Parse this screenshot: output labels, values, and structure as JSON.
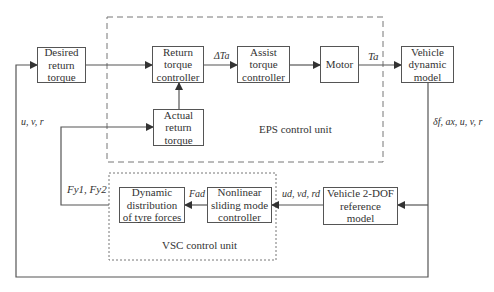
{
  "diagram": {
    "blocks": {
      "desired": "Desired\nreturn\ntorque",
      "return_ctrl": "Return\ntorque\ncontroller",
      "assist_ctrl": "Assist\ntorque\ncontroller",
      "motor": "Motor",
      "vehicle_model": "Vehicle\ndynamic\nmodel",
      "actual": "Actual\nreturn\ntorque",
      "distribution": "Dynamic\ndistribution\nof tyre forces",
      "smc": "Nonlinear\nsliding mode\ncontroller",
      "ref_model": "Vehicle 2-DOF\nreference\nmodel"
    },
    "groups": {
      "eps": "EPS control unit",
      "vsc": "VSC control unit"
    },
    "signals": {
      "delta_ta": "ΔTa",
      "ta": "Ta",
      "uvr": "u, v, r",
      "outputs": "δf, ax, u, v, r",
      "fy": "Fy1, Fy2",
      "fad": "Fad",
      "ref": "ud, vd, rd"
    },
    "colors": {
      "line": "#555555",
      "box": "#555555"
    }
  }
}
